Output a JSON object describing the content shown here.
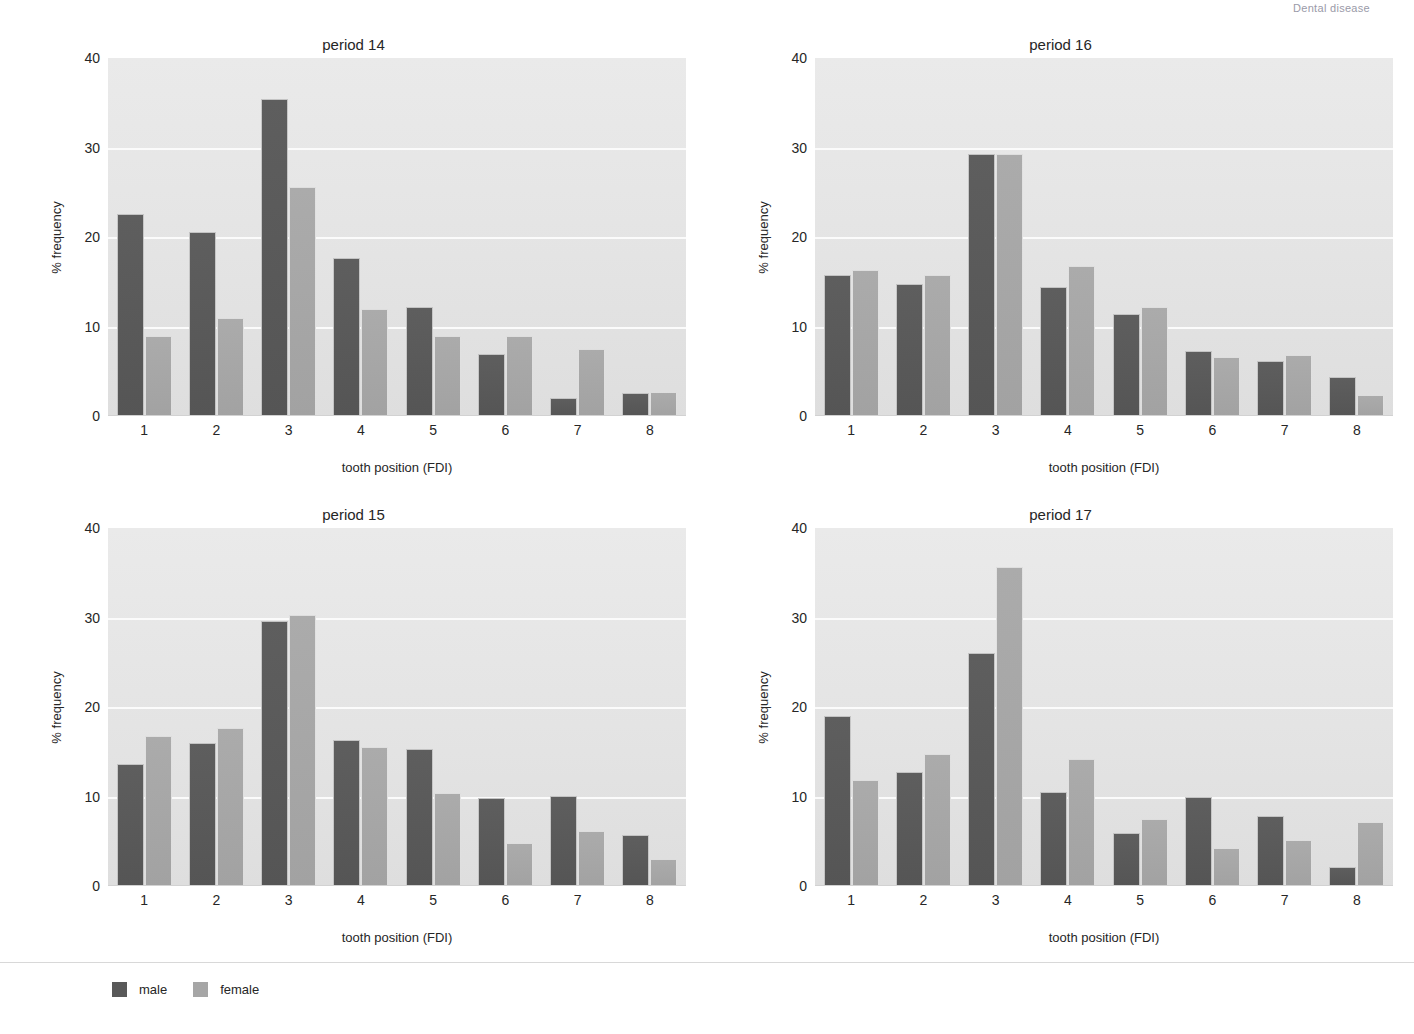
{
  "header": {
    "note": "Dental disease"
  },
  "axis": {
    "ylabel": "% frequency",
    "xlabel": "tooth position (FDI)",
    "yticks": [
      "40",
      "30",
      "20",
      "10",
      "0"
    ],
    "ymin": 0,
    "ymax": 40,
    "xticks": [
      "1",
      "2",
      "3",
      "4",
      "5",
      "6",
      "7",
      "8"
    ]
  },
  "legend": {
    "position": "bottom-left",
    "items": [
      {
        "label": "male",
        "color": "#595959"
      },
      {
        "label": "female",
        "color": "#a6a6a6"
      }
    ]
  },
  "colors": {
    "male": "#595959",
    "female": "#a6a6a6",
    "plot_background": "#e6e6e6",
    "gridline": "#ffffff",
    "text": "#262626"
  },
  "panels": [
    {
      "title": "period 14"
    },
    {
      "title": "period 16"
    },
    {
      "title": "period 15"
    },
    {
      "title": "period 17"
    }
  ],
  "chart_data": [
    {
      "type": "bar",
      "title": "period 14",
      "xlabel": "tooth position (FDI)",
      "ylabel": "% frequency",
      "ylim": [
        0,
        40
      ],
      "grid": true,
      "legend_position": "bottom-left",
      "categories": [
        "1",
        "2",
        "3",
        "4",
        "5",
        "6",
        "7",
        "8"
      ],
      "series": [
        {
          "name": "male",
          "values": [
            22.6,
            20.6,
            35.4,
            17.7,
            12.2,
            6.9,
            2.0,
            2.6
          ]
        },
        {
          "name": "female",
          "values": [
            8.9,
            10.9,
            25.6,
            12.0,
            8.9,
            8.9,
            7.5,
            2.7
          ]
        }
      ]
    },
    {
      "type": "bar",
      "title": "period 16",
      "xlabel": "tooth position (FDI)",
      "ylabel": "% frequency",
      "ylim": [
        0,
        40
      ],
      "grid": true,
      "legend_position": "bottom-left",
      "categories": [
        "1",
        "2",
        "3",
        "4",
        "5",
        "6",
        "7",
        "8"
      ],
      "series": [
        {
          "name": "male",
          "values": [
            15.8,
            14.8,
            29.3,
            14.4,
            11.4,
            7.3,
            6.2,
            4.4
          ]
        },
        {
          "name": "female",
          "values": [
            16.3,
            15.8,
            29.3,
            16.8,
            12.2,
            6.6,
            6.8,
            2.3
          ]
        }
      ]
    },
    {
      "type": "bar",
      "title": "period 15",
      "xlabel": "tooth position (FDI)",
      "ylabel": "% frequency",
      "ylim": [
        0,
        40
      ],
      "grid": true,
      "legend_position": "bottom-left",
      "categories": [
        "1",
        "2",
        "3",
        "4",
        "5",
        "6",
        "7",
        "8"
      ],
      "series": [
        {
          "name": "male",
          "values": [
            13.6,
            16.0,
            29.6,
            16.3,
            15.3,
            9.8,
            10.1,
            5.7
          ]
        },
        {
          "name": "female",
          "values": [
            16.8,
            17.7,
            30.3,
            15.5,
            10.4,
            4.8,
            6.2,
            3.0
          ]
        }
      ]
    },
    {
      "type": "bar",
      "title": "period 17",
      "xlabel": "tooth position (FDI)",
      "ylabel": "% frequency",
      "ylim": [
        0,
        40
      ],
      "grid": true,
      "legend_position": "bottom-left",
      "categories": [
        "1",
        "2",
        "3",
        "4",
        "5",
        "6",
        "7",
        "8"
      ],
      "series": [
        {
          "name": "male",
          "values": [
            19.0,
            12.7,
            26.0,
            10.5,
            5.9,
            10.0,
            7.8,
            2.1
          ]
        },
        {
          "name": "female",
          "values": [
            11.8,
            14.8,
            35.6,
            14.2,
            7.5,
            4.2,
            5.1,
            7.1
          ]
        }
      ]
    }
  ]
}
